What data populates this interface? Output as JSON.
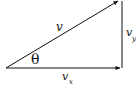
{
  "diagram": {
    "type": "vector-decomposition",
    "labels": {
      "hypotenuse": "v",
      "angle": "θ",
      "horizontal": "v",
      "horizontal_sub": "x",
      "vertical": "v",
      "vertical_sub": "y"
    },
    "colors": {
      "stroke": "#111111",
      "background": "#ffffff"
    }
  }
}
